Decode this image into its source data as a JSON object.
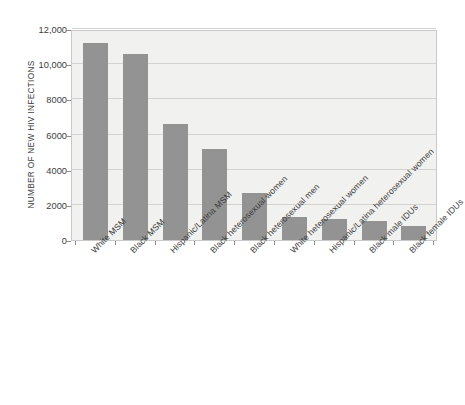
{
  "chart_data": {
    "type": "bar",
    "title": "",
    "xlabel": "",
    "ylabel": "NUMBER OF NEW HIV INFECTIONS",
    "categories": [
      "White MSM",
      "Black MSM",
      "Hispanic/Latina MSM",
      "Black heterosexual women",
      "Black heterosexual men",
      "White heterosexual women",
      "Hispanic/Latina heterosexual women",
      "Black male IDUs",
      "Black female IDUs"
    ],
    "values": [
      11200,
      10600,
      6600,
      5200,
      2700,
      1300,
      1200,
      1100,
      800
    ],
    "ylim": [
      0,
      12000
    ],
    "ytick_values": [
      0,
      2000,
      4000,
      6000,
      8000,
      10000,
      12000
    ],
    "ytick_labels": [
      "0",
      "2000",
      "4000",
      "6000",
      "8000",
      "10,000",
      "12,000"
    ],
    "grid": true,
    "legend": null,
    "bar_color": "#939393",
    "plot_background": "#f1f1ef",
    "gridline_color": "#d2d2d0",
    "axis_color": "#c9c9c9"
  }
}
